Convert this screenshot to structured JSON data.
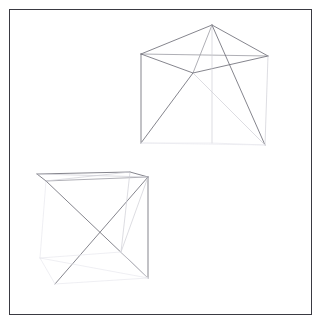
{
  "canvas": {
    "width": 323,
    "height": 329,
    "background_color": "#ffffff",
    "border_color": "#3a3a42",
    "border": {
      "x": 9,
      "y": 9,
      "width": 303,
      "height": 306
    }
  },
  "scene": {
    "title": "",
    "description": "Two 3D wireframe polyhedra rendered as line drawings",
    "shape_count": 2,
    "stroke_colors": {
      "strong": "#6f6f78",
      "medium": "#9a9aa2",
      "faint": "#cfcfd6",
      "very_faint": "#e6e6ec"
    }
  },
  "shapes": [
    {
      "id": "shape-upper-right",
      "name": "upper-right-wireframe-solid",
      "vertices": {
        "apex": [
          212,
          25
        ],
        "top_left": [
          141,
          54
        ],
        "top_right": [
          268,
          56
        ],
        "mid_front": [
          193,
          73
        ],
        "base_left": [
          141,
          143
        ],
        "base_mid": [
          212,
          143
        ],
        "base_right": [
          265,
          145
        ]
      },
      "edges": [
        {
          "from": "top_left",
          "to": "apex",
          "weight": "strong"
        },
        {
          "from": "apex",
          "to": "top_right",
          "weight": "strong"
        },
        {
          "from": "top_left",
          "to": "top_right",
          "weight": "medium"
        },
        {
          "from": "top_left",
          "to": "mid_front",
          "weight": "strong"
        },
        {
          "from": "mid_front",
          "to": "top_right",
          "weight": "strong"
        },
        {
          "from": "apex",
          "to": "mid_front",
          "weight": "medium"
        },
        {
          "from": "top_left",
          "to": "base_left",
          "weight": "strong"
        },
        {
          "from": "apex",
          "to": "base_mid",
          "weight": "faint"
        },
        {
          "from": "apex",
          "to": "base_right",
          "weight": "strong"
        },
        {
          "from": "mid_front",
          "to": "base_left",
          "weight": "strong"
        },
        {
          "from": "mid_front",
          "to": "base_right",
          "weight": "faint"
        },
        {
          "from": "top_right",
          "to": "base_right",
          "weight": "faint"
        },
        {
          "from": "base_left",
          "to": "base_mid",
          "weight": "very_faint"
        },
        {
          "from": "base_mid",
          "to": "base_right",
          "weight": "very_faint"
        },
        {
          "from": "base_left",
          "to": "base_right",
          "weight": "very_faint"
        }
      ]
    },
    {
      "id": "shape-lower-left",
      "name": "lower-left-wireframe-solid",
      "vertices": {
        "top_back_left": [
          37,
          174
        ],
        "top_back_right": [
          130,
          172
        ],
        "top_front_left": [
          46,
          181
        ],
        "top_front_right": [
          148,
          177
        ],
        "bot_back_left": [
          40,
          258
        ],
        "bot_back_right": [
          121,
          252
        ],
        "bot_front_left": [
          55,
          284
        ],
        "bot_front_right": [
          148,
          278
        ]
      },
      "edges": [
        {
          "from": "top_back_left",
          "to": "top_back_right",
          "weight": "strong"
        },
        {
          "from": "top_back_right",
          "to": "top_front_right",
          "weight": "strong"
        },
        {
          "from": "top_front_right",
          "to": "top_front_left",
          "weight": "medium"
        },
        {
          "from": "top_front_left",
          "to": "top_back_left",
          "weight": "strong"
        },
        {
          "from": "top_back_left",
          "to": "top_front_right",
          "weight": "faint"
        },
        {
          "from": "top_front_left",
          "to": "top_back_right",
          "weight": "faint"
        },
        {
          "from": "top_front_left",
          "to": "bot_front_right",
          "weight": "strong"
        },
        {
          "from": "top_front_right",
          "to": "bot_front_left",
          "weight": "strong"
        },
        {
          "from": "top_front_right",
          "to": "bot_front_right",
          "weight": "strong"
        },
        {
          "from": "top_back_right",
          "to": "bot_back_right",
          "weight": "faint"
        },
        {
          "from": "top_front_right",
          "to": "bot_back_right",
          "weight": "faint"
        },
        {
          "from": "bot_front_left",
          "to": "bot_front_right",
          "weight": "very_faint"
        },
        {
          "from": "bot_back_left",
          "to": "bot_back_right",
          "weight": "very_faint"
        },
        {
          "from": "bot_back_left",
          "to": "bot_front_left",
          "weight": "very_faint"
        },
        {
          "from": "bot_back_right",
          "to": "bot_front_right",
          "weight": "very_faint"
        },
        {
          "from": "bot_back_left",
          "to": "bot_front_right",
          "weight": "very_faint"
        },
        {
          "from": "top_front_left",
          "to": "bot_back_left",
          "weight": "very_faint"
        }
      ]
    }
  ]
}
